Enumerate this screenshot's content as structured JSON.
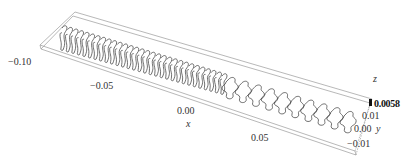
{
  "chart_data": {
    "type": "3d-surface-outline",
    "title": "",
    "axes": {
      "x": {
        "label": "x",
        "ticks": [
          "-0.10",
          "-0.05",
          "0.00",
          "0.05"
        ],
        "range": [
          -0.11,
          0.09
        ]
      },
      "y": {
        "label": "y",
        "ticks": [
          "-0.01",
          "0.00",
          "0.01"
        ],
        "range": [
          -0.012,
          0.012
        ]
      },
      "z": {
        "label": "z",
        "ticks": [
          "0.0058"
        ],
        "range": [
          0.0058,
          0.0058
        ]
      }
    },
    "series": [
      {
        "name": "contours",
        "count_dense_left": 30,
        "count_sparse_right": 10
      }
    ],
    "grid": false,
    "legend": null,
    "colors": {
      "line": "#333333",
      "box": "#8a8a8a",
      "background": "#ffffff"
    }
  },
  "labels": {
    "x_tick_1": "−0.10",
    "x_tick_2": "−0.05",
    "x_tick_3": "0.00",
    "x_tick_4": "0.05",
    "x_axis": "x",
    "y_tick_1": "0.01",
    "y_tick_2": "0.00",
    "y_tick_3": "−0.01",
    "y_axis": "y",
    "z_axis": "z",
    "z_tick": "0.0058"
  }
}
